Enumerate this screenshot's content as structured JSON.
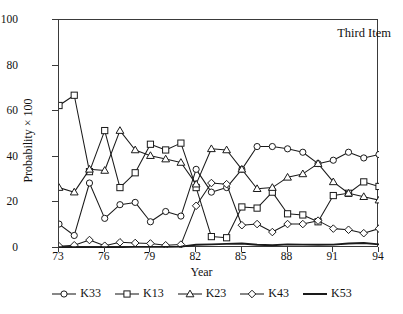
{
  "annotation": "Third Item",
  "chart_data": {
    "type": "line",
    "title": "",
    "xlabel": "Year",
    "ylabel": "Probability × 100",
    "xlim": [
      73,
      94
    ],
    "ylim": [
      0,
      100
    ],
    "grid": false,
    "legend_position": "bottom",
    "xticks": [
      "73",
      "76",
      "79",
      "82",
      "85",
      "88",
      "91",
      "94"
    ],
    "xtick_values": [
      73,
      76,
      79,
      82,
      85,
      88,
      91,
      94
    ],
    "yticks": [
      "0",
      "20",
      "40",
      "60",
      "80",
      "100"
    ],
    "ytick_values": [
      0,
      20,
      40,
      60,
      80,
      100
    ],
    "x": [
      73,
      74,
      75,
      76,
      77,
      78,
      79,
      80,
      81,
      82,
      83,
      84,
      85,
      86,
      87,
      88,
      89,
      90,
      91,
      92,
      93,
      94
    ],
    "series": [
      {
        "name": "K33",
        "marker": "circle",
        "color": "#1a1a1a",
        "values": [
          10.5,
          5.5,
          28.5,
          13,
          19,
          20,
          11.5,
          16,
          14,
          34.5,
          24.5,
          26.5,
          34.5,
          44.5,
          44.5,
          43.5,
          42,
          37,
          38.5,
          42,
          39.5,
          41
        ]
      },
      {
        "name": "K13",
        "marker": "square",
        "color": "#1a1a1a",
        "values": [
          62.5,
          67,
          33.5,
          51.5,
          26.5,
          33,
          45.5,
          43,
          46,
          26.5,
          5,
          4.5,
          18,
          17.5,
          24.5,
          15,
          14.5,
          11.5,
          23,
          24,
          29,
          27
        ]
      },
      {
        "name": "K23",
        "marker": "triangle",
        "color": "#1a1a1a",
        "values": [
          26.5,
          24.5,
          34.5,
          34,
          51.5,
          43,
          40.5,
          39,
          37.5,
          28,
          43.5,
          43,
          34.5,
          26,
          26.5,
          31,
          32.5,
          37,
          29,
          24,
          22.5,
          21
        ]
      },
      {
        "name": "K43",
        "marker": "diamond",
        "color": "#1a1a1a",
        "values": [
          0.8,
          1.2,
          3.5,
          1,
          2.5,
          2.2,
          2,
          1.2,
          1.5,
          18.5,
          28.5,
          28,
          10,
          10.5,
          7,
          10.5,
          10.5,
          12,
          8.5,
          8,
          6.5,
          8.5
        ]
      },
      {
        "name": "K53",
        "marker": "none",
        "color": "#1a1a1a",
        "values": [
          0.3,
          0.4,
          0.4,
          0.4,
          0.4,
          0.5,
          0.5,
          0.5,
          0.6,
          1.4,
          1.6,
          1.8,
          2.0,
          1.4,
          1.2,
          1.6,
          1.5,
          1.4,
          1.5,
          2.0,
          2.2,
          1.6
        ]
      }
    ]
  },
  "legend": [
    {
      "label": "K33",
      "marker": "circle"
    },
    {
      "label": "K13",
      "marker": "square"
    },
    {
      "label": "K23",
      "marker": "triangle"
    },
    {
      "label": "K43",
      "marker": "diamond"
    },
    {
      "label": "K53",
      "marker": "none"
    }
  ]
}
